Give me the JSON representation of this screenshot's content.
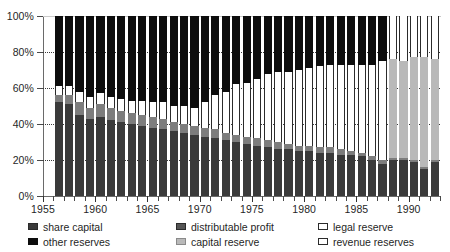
{
  "title_remnant": "",
  "legend": {
    "columns": [
      [
        {
          "key": "share_capital",
          "label": "share capital",
          "swatch": "sw-sc",
          "color": "#3a3a3a"
        },
        {
          "key": "other_reserves",
          "label": "other reserves",
          "swatch": "sw-or",
          "color": "#0d0d0d"
        }
      ],
      [
        {
          "key": "distributable_profit",
          "label": "distributable profit",
          "swatch": "sw-dp",
          "color": "#555555"
        },
        {
          "key": "capital_reserve",
          "label": "capital reserve",
          "swatch": "sw-cr",
          "color": "#b9b9b9"
        }
      ],
      [
        {
          "key": "legal_reserve",
          "label": "legal reserve",
          "swatch": "sw-lr",
          "color": "#ffffff"
        },
        {
          "key": "revenue_reserves",
          "label": "revenue reserves",
          "swatch": "sw-rr",
          "color": "#ffffff"
        }
      ]
    ]
  },
  "chart_data": {
    "type": "bar",
    "stacked": true,
    "stacked_mode": "percent",
    "title": "",
    "xlabel": "",
    "ylabel": "",
    "ylim": [
      0,
      100
    ],
    "yticks": [
      0,
      20,
      40,
      60,
      80,
      100
    ],
    "ytick_labels": [
      "0%",
      "20%",
      "40%",
      "60%",
      "80%",
      "100%"
    ],
    "xlim": [
      1955,
      1993
    ],
    "xticks": [
      1955,
      1960,
      1965,
      1970,
      1975,
      1980,
      1985,
      1990
    ],
    "xtick_labels": [
      "1955",
      "1960",
      "1965",
      "1970",
      "1975",
      "1980",
      "1985",
      "1990"
    ],
    "grid": "horizontal-dotted",
    "legend_position": "below",
    "categories": [
      1956,
      1957,
      1958,
      1959,
      1960,
      1961,
      1962,
      1963,
      1964,
      1965,
      1966,
      1967,
      1968,
      1969,
      1970,
      1971,
      1972,
      1973,
      1974,
      1975,
      1976,
      1977,
      1978,
      1979,
      1980,
      1981,
      1982,
      1983,
      1984,
      1985,
      1986,
      1987,
      1988,
      1989,
      1990,
      1991,
      1992
    ],
    "series": [
      {
        "name": "share capital",
        "key": "sc",
        "color": "#3a3a3a",
        "values": [
          52,
          51,
          45,
          43,
          44,
          42,
          41,
          40,
          39,
          38,
          37,
          36,
          35,
          34,
          33,
          32,
          31,
          30,
          29,
          28,
          27,
          26,
          26,
          25,
          25,
          24,
          24,
          23,
          23,
          22,
          20,
          18,
          20,
          20,
          19,
          15,
          19
        ]
      },
      {
        "name": "distributable profit",
        "key": "dp",
        "color": "#7d7d7d",
        "values": [
          4,
          5,
          7,
          6,
          7,
          7,
          6,
          6,
          6,
          6,
          6,
          5,
          5,
          5,
          5,
          5,
          4,
          4,
          4,
          4,
          4,
          4,
          3,
          3,
          3,
          3,
          3,
          3,
          2,
          2,
          2,
          2,
          1,
          1,
          1,
          1,
          1
        ]
      },
      {
        "name": "capital reserve",
        "key": "cr",
        "color": "#b9b9b9",
        "values": [
          0,
          0,
          0,
          0,
          0,
          0,
          0,
          0,
          0,
          0,
          0,
          0,
          0,
          0,
          0,
          0,
          0,
          0,
          0,
          0,
          0,
          0,
          0,
          0,
          0,
          0,
          0,
          0,
          0,
          0,
          0,
          0,
          55,
          54,
          57,
          61,
          56
        ]
      },
      {
        "name": "legal reserve",
        "key": "lr",
        "color": "#ffffff",
        "values": [
          5,
          5,
          6,
          6,
          6,
          6,
          7,
          7,
          8,
          8,
          9,
          9,
          10,
          10,
          10,
          11,
          11,
          12,
          12,
          12,
          13,
          13,
          13,
          14,
          14,
          14,
          14,
          14,
          14,
          14,
          14,
          14,
          0,
          0,
          0,
          0,
          0
        ]
      },
      {
        "name": "revenue reserves",
        "key": "rr",
        "color": "#ffffff",
        "values": [
          0,
          0,
          0,
          0,
          0,
          0,
          0,
          0,
          0,
          0,
          0,
          0,
          0,
          0,
          4,
          8,
          12,
          16,
          18,
          21,
          24,
          26,
          27,
          28,
          29,
          31,
          32,
          33,
          34,
          35,
          37,
          41,
          24,
          25,
          23,
          23,
          24
        ]
      },
      {
        "name": "other reserves",
        "key": "or",
        "color": "#0d0d0d",
        "values": [
          39,
          39,
          42,
          45,
          43,
          45,
          46,
          47,
          47,
          48,
          48,
          50,
          50,
          51,
          48,
          44,
          42,
          38,
          37,
          35,
          32,
          31,
          31,
          30,
          29,
          28,
          27,
          27,
          27,
          27,
          27,
          25,
          0,
          0,
          0,
          0,
          0
        ]
      }
    ]
  }
}
